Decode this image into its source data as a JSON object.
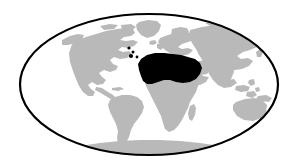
{
  "figure": {
    "name": "world-distribution-map",
    "type": "map",
    "projection": "mollweide-ellipse",
    "canvas": {
      "width": 298,
      "height": 168
    },
    "title": "",
    "caption": "",
    "labels": []
  },
  "colors": {
    "background": "#ffffff",
    "ocean": "#ffffff",
    "landmass": "#b9b9b9",
    "highlight": "#000000",
    "graticule_outline": "#000000"
  },
  "ellipse": {
    "center_x": 149,
    "center_y": 84.5,
    "radius_x": 130,
    "radius_y": 71.5,
    "stroke_width": 2.2
  },
  "legend": {
    "visible": false,
    "entries": [
      {
        "swatch": "#b9b9b9",
        "label": "Land"
      },
      {
        "swatch": "#000000",
        "label": "Highlighted range"
      }
    ]
  },
  "landmasses": [
    {
      "name": "north-america",
      "fill_key": "landmass"
    },
    {
      "name": "greenland",
      "fill_key": "landmass"
    },
    {
      "name": "south-america",
      "fill_key": "landmass"
    },
    {
      "name": "europe",
      "fill_key": "landmass"
    },
    {
      "name": "africa",
      "fill_key": "landmass"
    },
    {
      "name": "madagascar",
      "fill_key": "landmass"
    },
    {
      "name": "asia",
      "fill_key": "landmass"
    },
    {
      "name": "southeast-asia-islands",
      "fill_key": "landmass"
    },
    {
      "name": "australia",
      "fill_key": "landmass"
    },
    {
      "name": "new-zealand",
      "fill_key": "landmass"
    },
    {
      "name": "japan",
      "fill_key": "landmass"
    },
    {
      "name": "antarctica",
      "fill_key": "landmass"
    },
    {
      "name": "iceland",
      "fill_key": "landmass"
    },
    {
      "name": "british-isles",
      "fill_key": "landmass"
    }
  ],
  "highlight_regions": [
    {
      "name": "north-africa-sahara",
      "fill_key": "highlight"
    },
    {
      "name": "atlantic-island-dot-1",
      "fill_key": "highlight"
    },
    {
      "name": "atlantic-island-dot-2",
      "fill_key": "highlight"
    },
    {
      "name": "atlantic-island-dot-3",
      "fill_key": "highlight"
    },
    {
      "name": "atlantic-island-dot-4",
      "fill_key": "highlight"
    }
  ]
}
